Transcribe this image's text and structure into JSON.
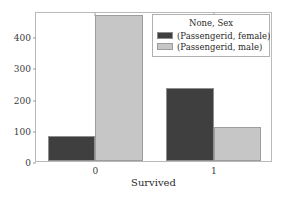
{
  "chart_data": {
    "type": "bar",
    "title": "",
    "xlabel": "Survived",
    "ylabel": "",
    "categories": [
      "0",
      "1"
    ],
    "series": [
      {
        "name": "(Passengerid, female)",
        "values": [
          81,
          233
        ],
        "color": "#3f3f3f"
      },
      {
        "name": "(Passengerid, male)",
        "values": [
          468,
          109
        ],
        "color": "#c6c6c6"
      }
    ],
    "ylim": [
      0,
      480
    ],
    "yticks": [
      0,
      100,
      200,
      300,
      400
    ],
    "ytick_labels": [
      "0",
      "100",
      "200",
      "300",
      "400"
    ],
    "xtick_labels": [
      "0",
      "1"
    ],
    "grid": false,
    "legend": {
      "title": "None, Sex",
      "position": "upper right",
      "entries": [
        {
          "label": "(Passengerid, female)",
          "swatch": "female"
        },
        {
          "label": "(Passengerid, male)",
          "swatch": "male"
        }
      ]
    }
  }
}
